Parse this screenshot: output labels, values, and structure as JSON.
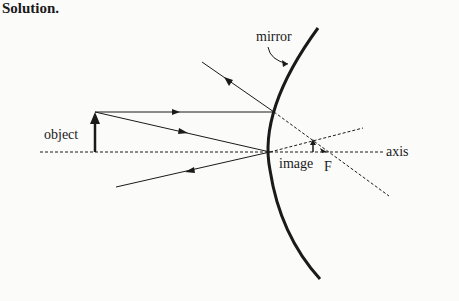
{
  "heading": "Solution.",
  "diagram": {
    "type": "concave-mirror-ray-diagram",
    "labels": {
      "mirror": "mirror",
      "object": "object",
      "image": "image",
      "focal_point": "F",
      "axis": "axis"
    },
    "colors": {
      "ink": "#1a1a1a",
      "background": "#fbfbfa"
    }
  }
}
